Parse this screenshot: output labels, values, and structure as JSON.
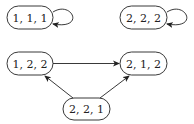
{
  "diagram": {
    "type": "state-transition-graph",
    "nodes": [
      {
        "id": "n111",
        "label": "1, 1, 1",
        "x": 30,
        "y": 17.5,
        "self_loop": true
      },
      {
        "id": "n222",
        "label": "2, 2, 2",
        "x": 143.5,
        "y": 17.5,
        "self_loop": true
      },
      {
        "id": "n122",
        "label": "1, 2, 2",
        "x": 30,
        "y": 63.5,
        "self_loop": false
      },
      {
        "id": "n212",
        "label": "2, 1, 2",
        "x": 143.5,
        "y": 63.5,
        "self_loop": false
      },
      {
        "id": "n221",
        "label": "2, 2, 1",
        "x": 86.5,
        "y": 109,
        "self_loop": false
      }
    ],
    "edges": [
      {
        "from": "n111",
        "to": "n111"
      },
      {
        "from": "n222",
        "to": "n222"
      },
      {
        "from": "n122",
        "to": "n212"
      },
      {
        "from": "n221",
        "to": "n122"
      },
      {
        "from": "n221",
        "to": "n212"
      }
    ],
    "colors": {
      "stroke": "#222222",
      "background": "#ffffff"
    }
  }
}
